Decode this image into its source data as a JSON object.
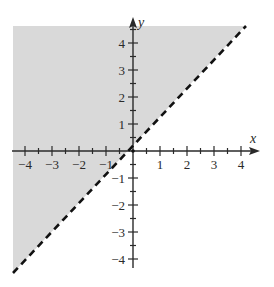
{
  "chart_data": {
    "type": "area",
    "title": "",
    "inequality": "y > x",
    "boundary": {
      "equation": "y = x",
      "slope": 1,
      "intercept": 0,
      "style": "dashed"
    },
    "shaded_region": "above-left of the line y = x",
    "xlabel": "x",
    "ylabel": "y",
    "xlim": [
      -4.5,
      4.5
    ],
    "ylim": [
      -4.5,
      4.5
    ],
    "x_ticks": [
      -4,
      -3,
      -2,
      -1,
      1,
      2,
      3,
      4
    ],
    "y_ticks": [
      -4,
      -3,
      -2,
      -1,
      1,
      2,
      3,
      4
    ],
    "x_tick_labels": [
      "−4",
      "−3",
      "−2",
      "−1",
      "1",
      "2",
      "3",
      "4"
    ],
    "y_tick_labels": [
      "4",
      "3",
      "2",
      "1",
      "−1",
      "−2",
      "−3",
      "−4"
    ],
    "minor_ticks_step": 0.5,
    "grid": false,
    "legend": null
  },
  "colors": {
    "shade": "#d9d9d9",
    "axis": "#2a2a2a",
    "boundary_line": "#111111",
    "background": "#ffffff"
  }
}
